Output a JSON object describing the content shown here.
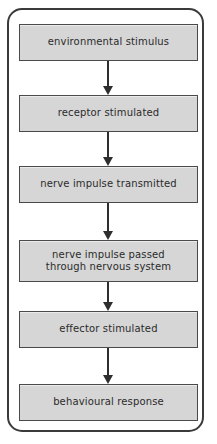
{
  "diagram": {
    "frame": {
      "shape": "rounded-rectangle",
      "border_color": "#3a3a3a"
    },
    "node_fill_color": "#d6d6d6",
    "node_border_color": "#4a4a4a",
    "arrow_color": "#2e2e2e",
    "text_color": "#2b2b2b",
    "nodes": [
      {
        "id": "environmental-stimulus",
        "label": "environmental stimulus"
      },
      {
        "id": "receptor-stimulated",
        "label": "receptor stimulated"
      },
      {
        "id": "nerve-impulse-transmitted",
        "label": "nerve impulse transmitted"
      },
      {
        "id": "nerve-impulse-passed",
        "label": "nerve impulse passed\nthrough nervous system"
      },
      {
        "id": "effector-stimulated",
        "label": "effector stimulated"
      },
      {
        "id": "behavioural-response",
        "label": "behavioural response"
      }
    ],
    "connectors": [
      {
        "id": "arrow-1",
        "from": "environmental-stimulus",
        "to": "receptor-stimulated",
        "direction": "down"
      },
      {
        "id": "arrow-2",
        "from": "receptor-stimulated",
        "to": "nerve-impulse-transmitted",
        "direction": "down"
      },
      {
        "id": "arrow-3",
        "from": "nerve-impulse-transmitted",
        "to": "nerve-impulse-passed",
        "direction": "down"
      },
      {
        "id": "arrow-4",
        "from": "nerve-impulse-passed",
        "to": "effector-stimulated",
        "direction": "down"
      },
      {
        "id": "arrow-5",
        "from": "effector-stimulated",
        "to": "behavioural-response",
        "direction": "down"
      }
    ]
  }
}
